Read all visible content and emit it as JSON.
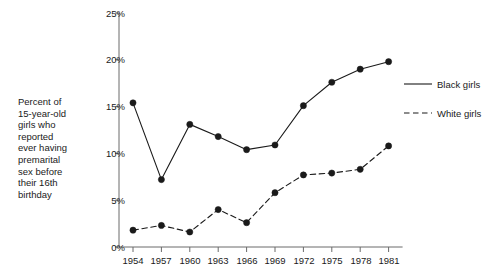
{
  "chart_data": {
    "type": "line",
    "title": "",
    "subtitle": "",
    "xlabel": "",
    "ylabel": "Percent of\n15-year-old\ngirls who\nreported\never having\npremarital\nsex before\ntheir 16th\nbirthday",
    "categories": [
      "1954",
      "1957",
      "1960",
      "1963",
      "1966",
      "1969",
      "1972",
      "1975",
      "1978",
      "1981"
    ],
    "x": [
      1954,
      1957,
      1960,
      1963,
      1966,
      1969,
      1972,
      1975,
      1978,
      1981
    ],
    "series": [
      {
        "name": "Black girls",
        "style": "solid",
        "marker": "filled-circle",
        "color": "#1a1a1a",
        "values": [
          15.4,
          7.2,
          13.1,
          11.8,
          10.4,
          10.9,
          15.1,
          17.6,
          19.0,
          19.8
        ]
      },
      {
        "name": "White girls",
        "style": "dashed",
        "marker": "filled-circle",
        "color": "#1a1a1a",
        "values": [
          1.8,
          2.3,
          1.6,
          4.0,
          2.6,
          5.8,
          7.7,
          7.9,
          8.3,
          10.8
        ]
      }
    ],
    "ylim": [
      0,
      25
    ],
    "yticks": [
      0,
      5,
      10,
      15,
      20,
      25
    ],
    "ytick_labels": [
      "0%",
      "5%",
      "10%",
      "15%",
      "20%",
      "25%"
    ],
    "grid": false,
    "legend_position": "right"
  },
  "legend": {
    "entries": [
      {
        "label": "Black girls"
      },
      {
        "label": "White girls"
      }
    ]
  },
  "axis": {
    "caption": "Percent of\n15-year-old\ngirls who\nreported\never having\npremarital\nsex before\ntheir 16th\nbirthday",
    "y_labels": [
      "25%",
      "20%",
      "15%",
      "10%",
      "5%",
      "0%"
    ],
    "x_labels": [
      "1954",
      "1957",
      "1960",
      "1963",
      "1966",
      "1969",
      "1972",
      "1975",
      "1978",
      "1981"
    ]
  },
  "colors": {
    "line": "#1a1a1a",
    "axis": "#6b6b6b",
    "background": "#ffffff"
  }
}
